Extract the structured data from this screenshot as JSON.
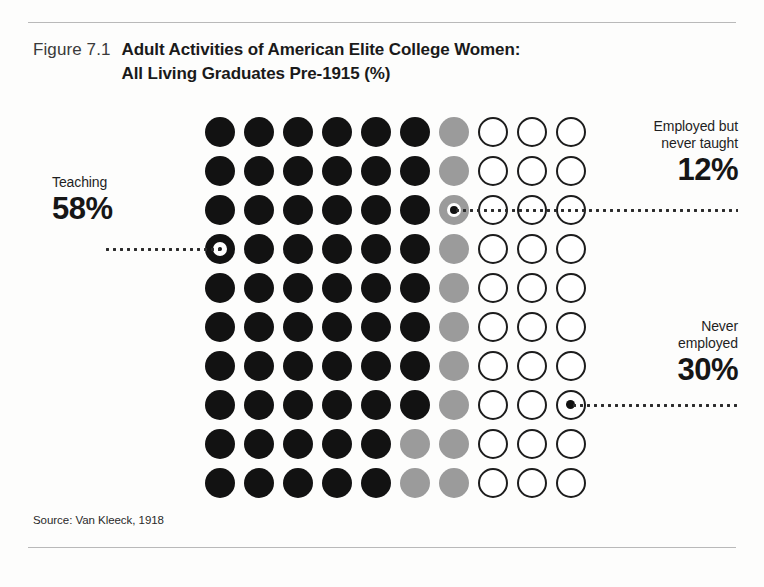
{
  "figure": {
    "number_label": "Figure 7.1",
    "title_line1": "Adult Activities of American Elite College Women:",
    "title_line2": "All Living Graduates Pre-1915 (%)",
    "source": "Source: Van Kleeck, 1918"
  },
  "callouts": {
    "teaching": {
      "caption": "Teaching",
      "value": "58%"
    },
    "employed_never_taught": {
      "caption_line1": "Employed but",
      "caption_line2": "never taught",
      "value": "12%"
    },
    "never_employed": {
      "caption_line1": "Never",
      "caption_line2": "employed",
      "value": "30%"
    }
  },
  "colors": {
    "filled": "#121212",
    "partial": "#9b9b9b",
    "empty_stroke": "#1c1c1c",
    "rule": "#b9b9b9",
    "text": "#1a1a1a"
  },
  "chart_data": {
    "type": "pie",
    "title": "Adult Activities of American Elite College Women: All Living Graduates Pre-1915 (%)",
    "subtitle": "",
    "xlabel": "",
    "ylabel": "",
    "unit": "percent",
    "total": 100,
    "grid_rows": 10,
    "grid_cols": 10,
    "dot_value": 1,
    "categories": [
      "Teaching",
      "Employed but never taught",
      "Never employed"
    ],
    "values": [
      58,
      12,
      30
    ],
    "series": [
      {
        "name": "Teaching",
        "value": 58,
        "style": "filled",
        "color": "#121212"
      },
      {
        "name": "Employed but never taught",
        "value": 12,
        "style": "partial",
        "color": "#9b9b9b"
      },
      {
        "name": "Never employed",
        "value": 30,
        "style": "empty",
        "color": "#ffffff"
      }
    ],
    "legend_position": "outside-left-and-right",
    "grid": false,
    "annotations": [
      {
        "label": "Teaching 58%",
        "side": "left",
        "anchor_row": 4,
        "anchor_col": 1
      },
      {
        "label": "Employed but never taught 12%",
        "side": "right",
        "anchor_row": 3,
        "anchor_col": 7
      },
      {
        "label": "Never employed 30%",
        "side": "right",
        "anchor_row": 8,
        "anchor_col": 10
      }
    ],
    "cells": [
      [
        "filled",
        "filled",
        "filled",
        "filled",
        "filled",
        "filled",
        "partial",
        "empty",
        "empty",
        "empty"
      ],
      [
        "filled",
        "filled",
        "filled",
        "filled",
        "filled",
        "filled",
        "partial",
        "empty",
        "empty",
        "empty"
      ],
      [
        "filled",
        "filled",
        "filled",
        "filled",
        "filled",
        "filled",
        "partial",
        "empty",
        "empty",
        "empty"
      ],
      [
        "filled",
        "filled",
        "filled",
        "filled",
        "filled",
        "filled",
        "partial",
        "empty",
        "empty",
        "empty"
      ],
      [
        "filled",
        "filled",
        "filled",
        "filled",
        "filled",
        "filled",
        "partial",
        "empty",
        "empty",
        "empty"
      ],
      [
        "filled",
        "filled",
        "filled",
        "filled",
        "filled",
        "filled",
        "partial",
        "empty",
        "empty",
        "empty"
      ],
      [
        "filled",
        "filled",
        "filled",
        "filled",
        "filled",
        "filled",
        "partial",
        "empty",
        "empty",
        "empty"
      ],
      [
        "filled",
        "filled",
        "filled",
        "filled",
        "filled",
        "filled",
        "partial",
        "empty",
        "empty",
        "empty"
      ],
      [
        "filled",
        "filled",
        "filled",
        "filled",
        "filled",
        "partial",
        "partial",
        "empty",
        "empty",
        "empty"
      ],
      [
        "filled",
        "filled",
        "filled",
        "filled",
        "filled",
        "partial",
        "partial",
        "empty",
        "empty",
        "empty"
      ]
    ]
  }
}
